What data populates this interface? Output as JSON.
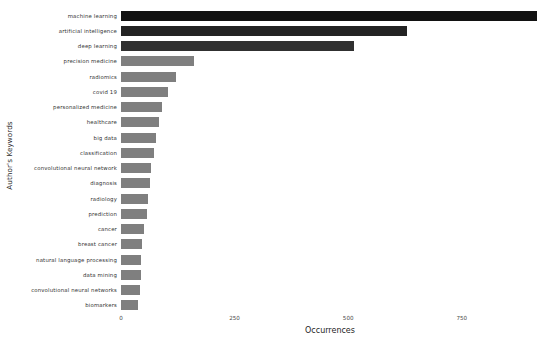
{
  "chart_data": {
    "type": "bar",
    "orientation": "horizontal",
    "title": "",
    "xlabel": "Occurrences",
    "ylabel": "Author's Keywords",
    "xlim": [
      0,
      920
    ],
    "xticks": [
      0,
      250,
      500,
      750
    ],
    "xtick_labels": [
      "0",
      "250",
      "500",
      "750"
    ],
    "grid": false,
    "legend": null,
    "categories": [
      "machine learning",
      "artificial intelligence",
      "deep learning",
      "precision medicine",
      "radiomics",
      "covid 19",
      "personalized medicine",
      "healthcare",
      "big data",
      "classification",
      "convolutional neural network",
      "diagnosis",
      "radiology",
      "prediction",
      "cancer",
      "breast cancer",
      "natural language processing",
      "data mining",
      "convolutional neural networks",
      "biomarkers"
    ],
    "values": [
      916,
      629,
      513,
      160,
      121,
      104,
      90,
      84,
      77,
      72,
      66,
      63,
      59,
      57,
      50,
      46,
      44,
      43,
      41,
      38
    ],
    "bar_colors": [
      "#121212",
      "#232323",
      "#303030",
      "#7f7f7f",
      "#7f7f7f",
      "#7f7f7f",
      "#7f7f7f",
      "#7f7f7f",
      "#7f7f7f",
      "#7f7f7f",
      "#7f7f7f",
      "#7f7f7f",
      "#7f7f7f",
      "#7f7f7f",
      "#7f7f7f",
      "#7f7f7f",
      "#7f7f7f",
      "#7f7f7f",
      "#7f7f7f",
      "#7f7f7f"
    ]
  },
  "background_color": "#ffffff",
  "text_color": "#333333"
}
